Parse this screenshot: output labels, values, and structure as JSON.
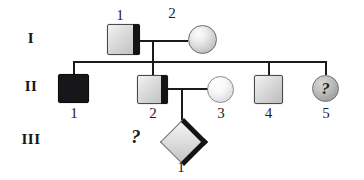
{
  "diagram": {
    "type": "pedigree-chart",
    "generations": [
      {
        "label": "I"
      },
      {
        "label": "II"
      },
      {
        "label": "III"
      }
    ],
    "individuals": [
      {
        "id": "I-1",
        "number": "1",
        "symbol": "square",
        "fill": "half-right",
        "label_position": "above"
      },
      {
        "id": "I-2",
        "number": "2",
        "symbol": "circle",
        "fill": "clear",
        "label_position": "above"
      },
      {
        "id": "II-1",
        "number": "1",
        "symbol": "square",
        "fill": "filled",
        "label_position": "below"
      },
      {
        "id": "II-2",
        "number": "2",
        "symbol": "square",
        "fill": "half-right",
        "label_position": "below"
      },
      {
        "id": "II-3",
        "number": "3",
        "symbol": "circle",
        "fill": "clear",
        "label_position": "below"
      },
      {
        "id": "II-4",
        "number": "4",
        "symbol": "square",
        "fill": "clear",
        "label_position": "below"
      },
      {
        "id": "II-5",
        "number": "5",
        "symbol": "circle",
        "fill": "shaded",
        "label_position": "below",
        "inner_text": "?"
      },
      {
        "id": "III-1",
        "number": "1",
        "symbol": "diamond",
        "fill": "half-upper-right",
        "label_position": "below"
      }
    ],
    "annotations": [
      {
        "name": "unknown-genotype-marker-iii-1",
        "text": "?"
      }
    ],
    "colors": {
      "line": "#1b1b1b",
      "filled_symbol": "#17171a",
      "clear_symbol": "#e0e0e0",
      "shaded_symbol": "#b4b4b4",
      "text": "#1d1d1d"
    }
  }
}
